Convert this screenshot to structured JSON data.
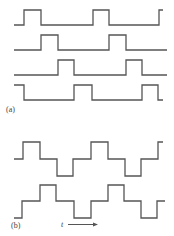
{
  "figure": {
    "panel_a": {
      "label": "(a)",
      "description": "Four-phase unipolar pulse trains, each shifted by one quarter period",
      "waveforms": [
        {
          "name": "phase-1",
          "points": "14,25 24,25 24,10 41,10 41,25 93,25 93,10 109,10 109,25 159,25 159,10 163,10"
        },
        {
          "name": "phase-2",
          "points": "14,50 41,50 41,35 58,35 58,50 109,50 109,35 126,35 126,50 167,50"
        },
        {
          "name": "phase-3",
          "points": "14,75 58,75 58,60 74,60 74,75 126,75 126,60 142,60 142,75 167,75"
        },
        {
          "name": "phase-4",
          "points": "14,85 24,85 24,100 74,100 74,85 92,85 92,100 142,100 142,85 158,85 158,100 163,100"
        }
      ]
    },
    "panel_b": {
      "label": "(b)",
      "description": "Two bipolar three-level waveforms in quadrature",
      "waveforms": [
        {
          "name": "bipolar-1",
          "points": "14,159 23,159 23,142 40,142 40,159 57,159 57,176 73,176 73,159 91,159 91,142 108,142 108,159 125,159 125,176 141,176 141,159 158,159 158,142 163,142"
        },
        {
          "name": "bipolar-2",
          "points": "14,218 22,218 22,201 40,201 40,185 56,185 56,201 74,201 74,218 91,218 91,201 108,201 108,185 124,185 124,201 141,201 141,218 157,218 157,201 165,201"
        }
      ],
      "time_axis": {
        "label": "t",
        "arrow": "right"
      }
    }
  }
}
